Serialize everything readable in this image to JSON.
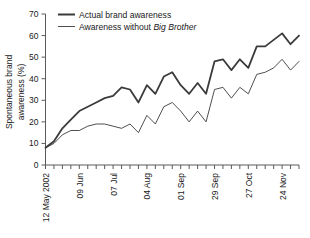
{
  "chart_data": {
    "type": "line",
    "title": "",
    "xlabel": "",
    "ylabel": "Spontaneous brand awareness (%)",
    "ylabel_line1": "Spontaneous brand",
    "ylabel_line2": "awareness (%)",
    "ylim": [
      0,
      70
    ],
    "yticks": [
      0,
      10,
      20,
      30,
      40,
      50,
      60,
      70
    ],
    "ytick_labels": [
      "0",
      "10",
      "20",
      "30",
      "40",
      "50",
      "60",
      "70"
    ],
    "grid": false,
    "legend_position": "top-left",
    "x_tick_count": 31,
    "x": [
      "12 May 2002",
      "19 May",
      "26 May",
      "02 Jun",
      "09 Jun",
      "16 Jun",
      "23 Jun",
      "30 Jun",
      "07 Jul",
      "14 Jul",
      "21 Jul",
      "28 Jul",
      "04 Aug",
      "11 Aug",
      "18 Aug",
      "25 Aug",
      "01 Sep",
      "08 Sep",
      "15 Sep",
      "22 Sep",
      "29 Sep",
      "06 Oct",
      "13 Oct",
      "20 Oct",
      "27 Oct",
      "03 Nov",
      "10 Nov",
      "17 Nov",
      "24 Nov",
      "01 Dec",
      "08 Dec"
    ],
    "xtick_labels_shown": [
      "12 May 2002",
      "09 Jun",
      "07 Jul",
      "04 Aug",
      "01 Sep",
      "29 Sep",
      "27 Oct",
      "24 Nov"
    ],
    "xtick_label_indices": [
      0,
      4,
      8,
      12,
      16,
      20,
      24,
      28
    ],
    "series": [
      {
        "name": "Actual brand awareness",
        "style": "thick",
        "color": "#3b3b3b",
        "values": [
          8,
          11,
          17,
          21,
          25,
          27,
          29,
          31,
          32,
          36,
          35,
          29,
          37,
          33,
          41,
          43,
          37,
          33,
          38,
          33,
          48,
          49,
          44,
          49,
          45,
          55,
          55,
          58,
          61,
          56,
          60
        ]
      },
      {
        "name": "Awareness without Big Brother",
        "name_plain": "Awareness without ",
        "name_italic": "Big Brother",
        "style": "thin",
        "color": "#3b3b3b",
        "values": [
          8,
          10,
          14,
          16,
          16,
          18,
          19,
          19,
          18,
          17,
          19,
          15,
          23,
          19,
          27,
          29,
          25,
          20,
          25,
          20,
          35,
          36,
          31,
          36,
          33,
          42,
          43,
          45,
          49,
          44,
          48
        ]
      }
    ]
  },
  "legend": {
    "items": [
      {
        "label": "Actual brand awareness",
        "style": "thick"
      },
      {
        "label_plain": "Awareness without ",
        "label_italic": "Big Brother",
        "style": "thin"
      }
    ]
  },
  "colors": {
    "line": "#3b3b3b",
    "axis": "#5a5a5a",
    "text": "#1a1a1a",
    "background": "#ffffff"
  }
}
